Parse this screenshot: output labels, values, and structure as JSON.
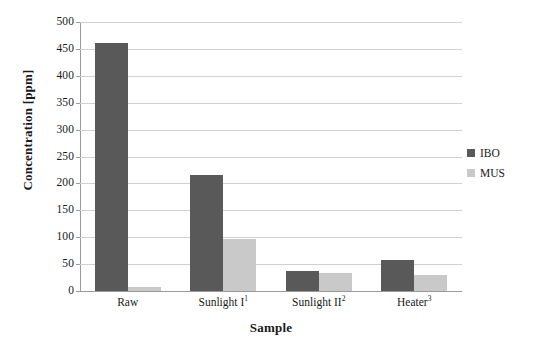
{
  "chart_data": {
    "type": "bar",
    "title": "",
    "xlabel": "Sample",
    "ylabel": "Concentration [ppm]",
    "categories": [
      "Raw",
      "Sunlight I",
      "Sunlight II",
      "Heater"
    ],
    "category_footnotes": [
      "",
      "1",
      "2",
      "3"
    ],
    "category_labels_full": [
      "Raw",
      "Sunlight I¹",
      "Sunlight II²",
      "Heater³"
    ],
    "series": [
      {
        "name": "IBO",
        "color": "#595959",
        "values": [
          461,
          216,
          37,
          57
        ]
      },
      {
        "name": "MUS",
        "color": "#c9c9c9",
        "values": [
          8,
          96,
          33,
          30
        ]
      }
    ],
    "ylim": [
      0,
      500
    ],
    "ytick_step": 50,
    "yticks": [
      500,
      450,
      400,
      350,
      300,
      250,
      200,
      150,
      100,
      50,
      0
    ],
    "ytick_labels": [
      "500",
      "450",
      "400",
      "350",
      "300",
      "250",
      "200",
      "150",
      "100",
      "50",
      "0"
    ],
    "grid": true,
    "grid_axis": "y",
    "grid_color": "#d0d0d0",
    "axis_color": "#9a9a9a",
    "legend_position": "right",
    "legend_entries": [
      "IBO",
      "MUS"
    ],
    "background_color": "#ffffff"
  },
  "axes": {
    "y_title": "Concentration [ppm]",
    "x_title": "Sample"
  }
}
